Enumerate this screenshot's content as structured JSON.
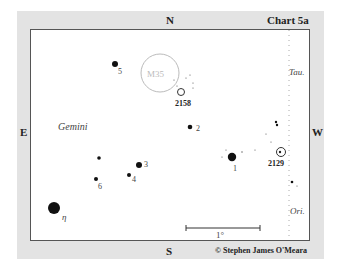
{
  "header": {
    "north": "N",
    "chart_title": "Chart 5a"
  },
  "directions": {
    "north": "N",
    "south": "S",
    "east": "E",
    "west": "W"
  },
  "constellations": {
    "gemini": "Gemini",
    "taurus": "Tau.",
    "orion": "Ori."
  },
  "objects": {
    "m35": "M35",
    "ngc2158": "2158",
    "ngc2129": "2129"
  },
  "stars": [
    {
      "label": "5"
    },
    {
      "label": "2"
    },
    {
      "label": "3"
    },
    {
      "label": "4"
    },
    {
      "label": "6"
    },
    {
      "label": "1"
    },
    {
      "label": "η"
    }
  ],
  "scale_bar": {
    "label": "1°"
  },
  "copyright": "© Stephen James O'Meara"
}
